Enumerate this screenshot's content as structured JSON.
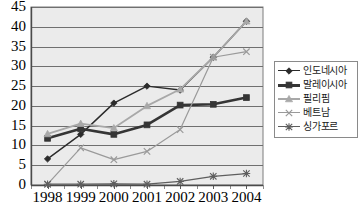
{
  "chart_data": {
    "type": "line",
    "title": "",
    "subtitle": "",
    "xlabel": "",
    "ylabel": "",
    "x": [
      "1998",
      "1999",
      "2000",
      "2001",
      "2002",
      "2003",
      "2004"
    ],
    "categories": [
      "1998",
      "1999",
      "2000",
      "2001",
      "2002",
      "2003",
      "2004"
    ],
    "ylim": [
      0,
      45
    ],
    "ytick_step": 5,
    "yticks": [
      "0",
      "5",
      "10",
      "15",
      "20",
      "25",
      "30",
      "35",
      "40",
      "45"
    ],
    "grid": "horizontal",
    "legend_position": "right",
    "plot_background": "#ebebeb",
    "series": [
      {
        "name": "인도네시아",
        "marker": "diamond",
        "color": "#2b2b2b",
        "line_width": 1.4,
        "values": [
          6.6,
          12.8,
          20.7,
          25.0,
          24.0,
          32.3,
          41.4
        ]
      },
      {
        "name": "말레이시아",
        "marker": "square",
        "color": "#353535",
        "line_width": 2.6,
        "values": [
          11.8,
          14.2,
          12.8,
          15.2,
          20.2,
          20.4,
          22.1
        ]
      },
      {
        "name": "필리핌",
        "marker": "triangle",
        "color": "#a8a8a8",
        "line_width": 1.8,
        "values": [
          12.9,
          15.5,
          14.4,
          20.0,
          24.2,
          32.3,
          41.4
        ]
      },
      {
        "name": "베트남",
        "marker": "cross",
        "color": "#9a9a9a",
        "line_width": 1.2,
        "values": [
          0.2,
          9.4,
          6.4,
          8.5,
          14.0,
          32.3,
          33.7
        ]
      },
      {
        "name": "싱가포르",
        "marker": "star",
        "color": "#5e5e5e",
        "line_width": 1.2,
        "values": [
          0.2,
          0.2,
          0.3,
          0.2,
          0.9,
          2.2,
          2.9
        ]
      }
    ]
  },
  "legend": {
    "items": [
      {
        "label": "인도네시아"
      },
      {
        "label": "말레이시아"
      },
      {
        "label": "필리핌"
      },
      {
        "label": "베트남"
      },
      {
        "label": "싱가포르"
      }
    ]
  }
}
